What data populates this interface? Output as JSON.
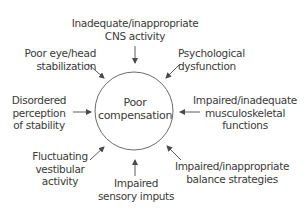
{
  "diagram": {
    "center": {
      "line1": "Poor",
      "line2": "compensation"
    },
    "factors": [
      {
        "id": "top",
        "line1": "Inadequate/inappropriate",
        "line2": "CNS activity"
      },
      {
        "id": "top-left",
        "line1": "Poor eye/head",
        "line2": "stabilization"
      },
      {
        "id": "top-right",
        "line1": "Psychological",
        "line2": "dysfunction"
      },
      {
        "id": "left",
        "line1": "Disordered",
        "line2": "perception",
        "line3": "of stability"
      },
      {
        "id": "right",
        "line1": "Impaired/inadequate",
        "line2": "musculoskeletal",
        "line3": "functions"
      },
      {
        "id": "bottom-left",
        "line1": "Fluctuating",
        "line2": "vestibular",
        "line3": "activity"
      },
      {
        "id": "bottom",
        "line1": "Impaired",
        "line2": "sensory imputs"
      },
      {
        "id": "bottom-right",
        "line1": "Impaired/inappropriate",
        "line2": "balance strategies"
      }
    ],
    "colors": {
      "stroke": "#4a4a4a",
      "text": "#3a3a3a",
      "background": "#ffffff"
    }
  }
}
